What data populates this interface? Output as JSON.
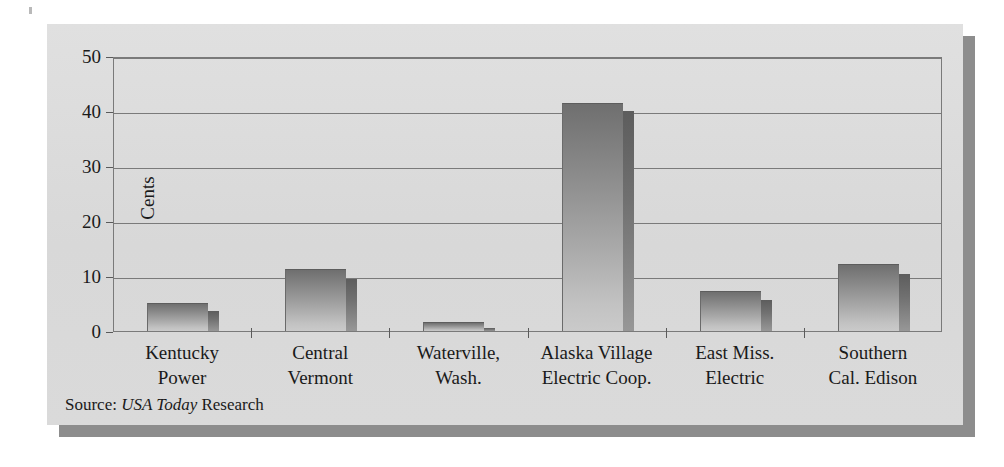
{
  "chart_data": {
    "type": "bar",
    "title": "",
    "xlabel": "",
    "ylabel": "Cents",
    "ylim": [
      0,
      50
    ],
    "yticks": [
      0,
      10,
      20,
      30,
      40,
      50
    ],
    "ytick_labels": [
      "0",
      "10",
      "20",
      "30",
      "40",
      "50"
    ],
    "grid": true,
    "legend": "none",
    "categories": [
      "Kentucky Power",
      "Central Vermont",
      "Waterville, Wash.",
      "Alaska Village Electric Coop.",
      "East Miss. Electric",
      "Southern Cal. Edison"
    ],
    "category_lines": [
      [
        "Kentucky",
        "Power"
      ],
      [
        "Central",
        "Vermont"
      ],
      [
        "Waterville,",
        "Wash."
      ],
      [
        "Alaska Village",
        "Electric Coop."
      ],
      [
        "East Miss.",
        "Electric"
      ],
      [
        "Southern",
        "Cal. Edison"
      ]
    ],
    "values": [
      5.1,
      11.2,
      1.6,
      41.5,
      7.2,
      12.1
    ],
    "side_values": [
      3.7,
      9.5,
      0.6,
      40.0,
      5.7,
      10.4
    ],
    "units": "cents per kilowatt-hour"
  },
  "figure": {
    "source_prefix": "Source:",
    "source_italic": "USA Today",
    "source_suffix": "Research",
    "panel_color": "#dcdcdc",
    "shadow_color": "#8d8d8d",
    "axis_color": "#7a7a7a",
    "bar_face_top_color": "#6f6f6f",
    "bar_face_bottom_color": "#cacaca",
    "bar_side_color": "#707070",
    "text_color": "#1a1a1a"
  }
}
